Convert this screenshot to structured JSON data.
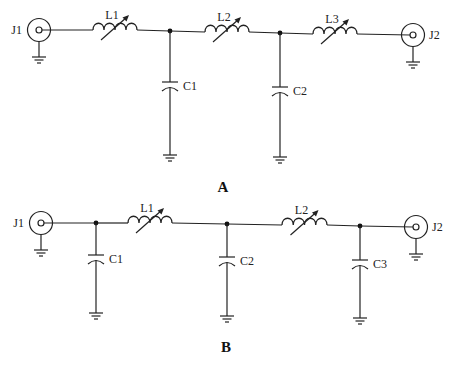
{
  "diagram_a": {
    "caption": "A",
    "connectors": [
      {
        "id": "J1",
        "label": "J1",
        "cx": 39,
        "cy": 30
      },
      {
        "id": "J2",
        "label": "J2",
        "cx": 413,
        "cy": 35
      }
    ],
    "inductors": [
      {
        "id": "L1",
        "label": "L1",
        "x1": 93,
        "x2": 137,
        "y": 30,
        "variable": true
      },
      {
        "id": "L2",
        "label": "L2",
        "x1": 205,
        "x2": 249,
        "y": 32,
        "variable": true
      },
      {
        "id": "L3",
        "label": "L3",
        "x1": 313,
        "x2": 357,
        "y": 34,
        "variable": true
      }
    ],
    "capacitors": [
      {
        "id": "C1",
        "label": "C1",
        "x": 170,
        "node_y": 31,
        "cap_y": 85,
        "gnd_y": 155
      },
      {
        "id": "C2",
        "label": "C2",
        "x": 280,
        "node_y": 33,
        "cap_y": 90,
        "gnd_y": 157
      }
    ]
  },
  "diagram_b": {
    "caption": "B",
    "connectors": [
      {
        "id": "J1",
        "label": "J1",
        "cx": 41,
        "cy": 223
      },
      {
        "id": "J2",
        "label": "J2",
        "cx": 416,
        "cy": 227
      }
    ],
    "inductors": [
      {
        "id": "L1",
        "label": "L1",
        "x1": 128,
        "x2": 172,
        "y": 223,
        "variable": true
      },
      {
        "id": "L2",
        "label": "L2",
        "x1": 282,
        "x2": 327,
        "y": 225,
        "variable": true
      }
    ],
    "capacitors": [
      {
        "id": "C1",
        "label": "C1",
        "x": 96,
        "node_y": 223,
        "cap_y": 258,
        "gnd_y": 313
      },
      {
        "id": "C2",
        "label": "C2",
        "x": 227,
        "node_y": 224,
        "cap_y": 260,
        "gnd_y": 316
      },
      {
        "id": "C3",
        "label": "C3",
        "x": 360,
        "node_y": 226,
        "cap_y": 263,
        "gnd_y": 318
      }
    ]
  }
}
